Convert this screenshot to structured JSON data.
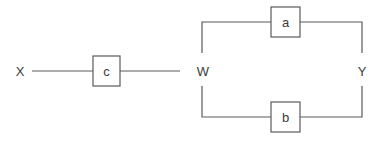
{
  "diagram": {
    "nodes": {
      "x": "X",
      "w": "W",
      "y": "Y"
    },
    "blocks": {
      "c": "c",
      "a": "a",
      "b": "b"
    },
    "connections": [
      {
        "from": "X",
        "via": "c",
        "to": "W"
      },
      {
        "from": "W",
        "via": "a",
        "to": "Y",
        "branch": "upper"
      },
      {
        "from": "W",
        "via": "b",
        "to": "Y",
        "branch": "lower"
      }
    ],
    "colors": {
      "line": "#5a5a5a",
      "text": "#3a3a3a",
      "background": "#ffffff"
    }
  }
}
